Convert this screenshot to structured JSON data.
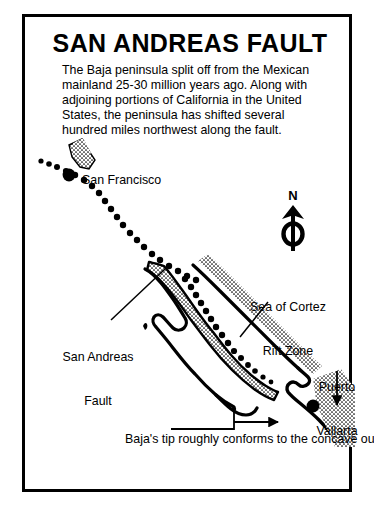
{
  "figure": {
    "title": "SAN ANDREAS FAULT",
    "intro": "The Baja peninsula split off from the Mexican mainland 25-30 million years ago.  Along with adjoining portions of California in the United States, the peninsula has shifted several hundred miles northwest along the fault.",
    "border_color": "#000000",
    "background_color": "#ffffff",
    "ink_color": "#000000"
  },
  "map": {
    "labels": {
      "san_francisco": "San Francisco",
      "sea_of_cortez_line1": "Sea of Cortez",
      "sea_of_cortez_line2": "Rift Zone",
      "san_andreas_line1": "San Andreas",
      "san_andreas_line2": "Fault",
      "puerto_vallarta_line1": "Puerto",
      "puerto_vallarta_line2": "Vallarta",
      "caption": "Baja's tip roughly conforms to the concave outline of the mainland coast."
    },
    "compass": {
      "north_label": "N"
    },
    "cities": [
      {
        "name": "San Francisco",
        "marker": "filled-dot"
      },
      {
        "name": "Puerto Vallarta",
        "marker": "filled-dot"
      }
    ],
    "features": [
      {
        "name": "San Andreas Fault",
        "style": "dotted-line"
      },
      {
        "name": "Sea of Cortez Rift Zone",
        "style": "dotted-line"
      },
      {
        "name": "Baja peninsula",
        "style": "stippled-landmass"
      },
      {
        "name": "Mexican mainland",
        "style": "stippled-landmass"
      },
      {
        "name": "California coast",
        "style": "stippled-landmass"
      }
    ]
  }
}
